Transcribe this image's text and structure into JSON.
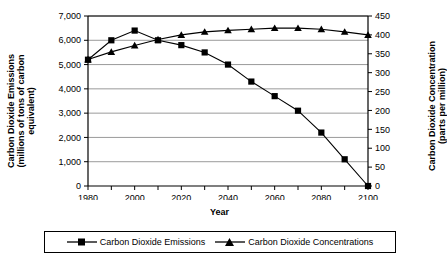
{
  "chart_data": {
    "type": "line",
    "title": "",
    "xlabel": "Year",
    "ylabel": "Carbon Dioxide Emissions (millions of tons of carbon equivalent)",
    "y2label": "Carbon Dioxide Concentration (parts per million)",
    "x": [
      1980,
      1990,
      2000,
      2010,
      2020,
      2030,
      2040,
      2050,
      2060,
      2070,
      2080,
      2090,
      2100
    ],
    "xlim": [
      1980,
      2100
    ],
    "xticks": [
      1980,
      1990,
      2000,
      2010,
      2020,
      2030,
      2040,
      2050,
      2060,
      2070,
      2080,
      2090,
      2100
    ],
    "xtick_labels": [
      "1980",
      "",
      "2000",
      "",
      "2020",
      "",
      "2040",
      "",
      "2060",
      "",
      "2080",
      "",
      "2100"
    ],
    "ylim": [
      0,
      7000
    ],
    "yticks": [
      0,
      1000,
      2000,
      3000,
      4000,
      5000,
      6000,
      7000
    ],
    "ytick_labels": [
      "0",
      "1,000",
      "2,000",
      "3,000",
      "4,000",
      "5,000",
      "6,000",
      "7,000"
    ],
    "y2lim": [
      0,
      450
    ],
    "y2ticks": [
      0,
      50,
      100,
      150,
      200,
      250,
      300,
      350,
      400,
      450
    ],
    "y2tick_labels": [
      "0",
      "50",
      "100",
      "150",
      "200",
      "250",
      "300",
      "350",
      "400",
      "450"
    ],
    "grid": "horizontal",
    "legend_position": "bottom",
    "series": [
      {
        "name": "Carbon Dioxide Emissions",
        "axis": "left",
        "marker": "square",
        "color": "#000000",
        "values": [
          5200,
          6000,
          6400,
          6000,
          5800,
          5500,
          5000,
          4300,
          3700,
          3100,
          2200,
          1100,
          0
        ]
      },
      {
        "name": "Carbon Dioxide Concentrations",
        "axis": "right",
        "marker": "triangle",
        "color": "#000000",
        "values": [
          335,
          355,
          372,
          388,
          400,
          408,
          412,
          415,
          418,
          418,
          415,
          408,
          400
        ]
      }
    ]
  },
  "axis_titles": {
    "left_line1": "Carbon Dioxide Emissions",
    "left_line2": "(millions of tons of carbon",
    "left_line3": "equivalent)",
    "right_line1": "Carbon Dioxide Concentration",
    "right_line2": "(parts per million)",
    "x_title": "Year"
  },
  "legend": {
    "items": [
      {
        "label": "Carbon Dioxide Emissions",
        "marker": "square-marker"
      },
      {
        "label": "Carbon Dioxide Concentrations",
        "marker": "triangle-marker"
      }
    ]
  },
  "colors": {
    "line": "#000000",
    "grid": "#808080",
    "axis": "#000000",
    "background": "#ffffff"
  }
}
